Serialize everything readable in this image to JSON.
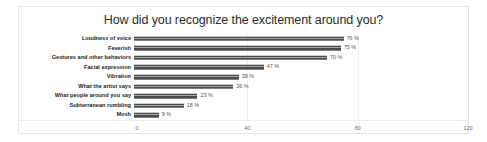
{
  "chart_data": {
    "type": "bar",
    "orientation": "horizontal",
    "title": "How did you recognize the excitement around you?",
    "xlabel": "",
    "ylabel": "",
    "xlim": [
      0,
      120
    ],
    "xticks": [
      "0",
      "40",
      "80",
      "120"
    ],
    "grid": true,
    "legend": false,
    "value_suffix": " %",
    "categories": [
      "Loudness of voice",
      "Feverish",
      "Gestures and other behaviors",
      "Facial expression",
      "Vibration",
      "What the artist says",
      "What people around you say",
      "Subterranean rumbling",
      "Mosh"
    ],
    "values": [
      76,
      75,
      70,
      47,
      38,
      36,
      23,
      18,
      9
    ],
    "data_labels": [
      "76 %",
      "75 %",
      "70 %",
      "47 %",
      "38 %",
      "36 %",
      "23 %",
      "18 %",
      "9 %"
    ],
    "bar_color": "#4a4a4a",
    "bar_highlight_color": "#a8a8a8",
    "border_color": "#e3e3e3"
  }
}
